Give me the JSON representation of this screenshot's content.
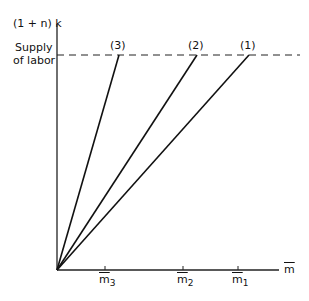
{
  "diagram": {
    "y_axis_label": "(1 + n) k",
    "supply_label_line1": "Supply",
    "supply_label_line2": "of labor",
    "x_axis_label": "m",
    "lines": [
      {
        "label": "(3)",
        "end_x": 119
      },
      {
        "label": "(2)",
        "end_x": 197
      },
      {
        "label": "(1)",
        "end_x": 249
      }
    ],
    "ticks": [
      {
        "label": "m",
        "sub": "3",
        "x": 105
      },
      {
        "label": "m",
        "sub": "2",
        "x": 183
      },
      {
        "label": "m",
        "sub": "1",
        "x": 238
      }
    ]
  }
}
